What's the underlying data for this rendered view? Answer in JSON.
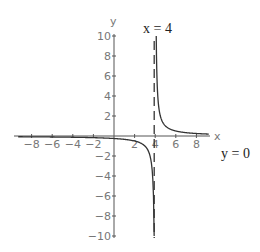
{
  "chart_data": {
    "type": "line",
    "title": "",
    "xlabel": "x",
    "ylabel": "y",
    "xlim": [
      -9,
      9.3
    ],
    "ylim": [
      -10,
      10
    ],
    "grid": false,
    "function": "y = 1/(x - 4)",
    "x_ticks": [
      -8,
      -6,
      -4,
      -2,
      2,
      4,
      6,
      8
    ],
    "y_ticks": [
      -10,
      -8,
      -6,
      -4,
      -2,
      2,
      4,
      6,
      8,
      10
    ],
    "x_tick_labels": [
      "−8",
      "−6",
      "−4",
      "−2",
      "2",
      "4",
      "6",
      "8"
    ],
    "y_tick_labels": [
      "−10",
      "−8",
      "−6",
      "−4",
      "−2",
      "2",
      "4",
      "6",
      "8",
      "10"
    ],
    "series": [
      {
        "name": "f(x) left branch",
        "x": [
          -9,
          -8,
          -6,
          -4,
          -2,
          0,
          2,
          3,
          3.5,
          3.8,
          3.9
        ],
        "y": [
          -0.077,
          -0.083,
          -0.1,
          -0.125,
          -0.167,
          -0.25,
          -0.5,
          -1,
          -2,
          -5,
          -10
        ]
      },
      {
        "name": "f(x) right branch",
        "x": [
          4.1,
          4.2,
          4.5,
          5,
          6,
          7,
          8,
          9
        ],
        "y": [
          10,
          5,
          2,
          1,
          0.5,
          0.333,
          0.25,
          0.2
        ]
      }
    ],
    "asymptotes": [
      {
        "type": "vertical",
        "value": 4,
        "label": "x = 4",
        "style": "dashed"
      },
      {
        "type": "horizontal",
        "value": 0,
        "label": "y = 0"
      }
    ],
    "annotations": [
      "x = 4",
      "y = 0"
    ]
  },
  "labels": {
    "x_axis": "x",
    "y_axis": "y",
    "vertical_asymptote": "x = 4",
    "horizontal_asymptote": "y = 0"
  }
}
